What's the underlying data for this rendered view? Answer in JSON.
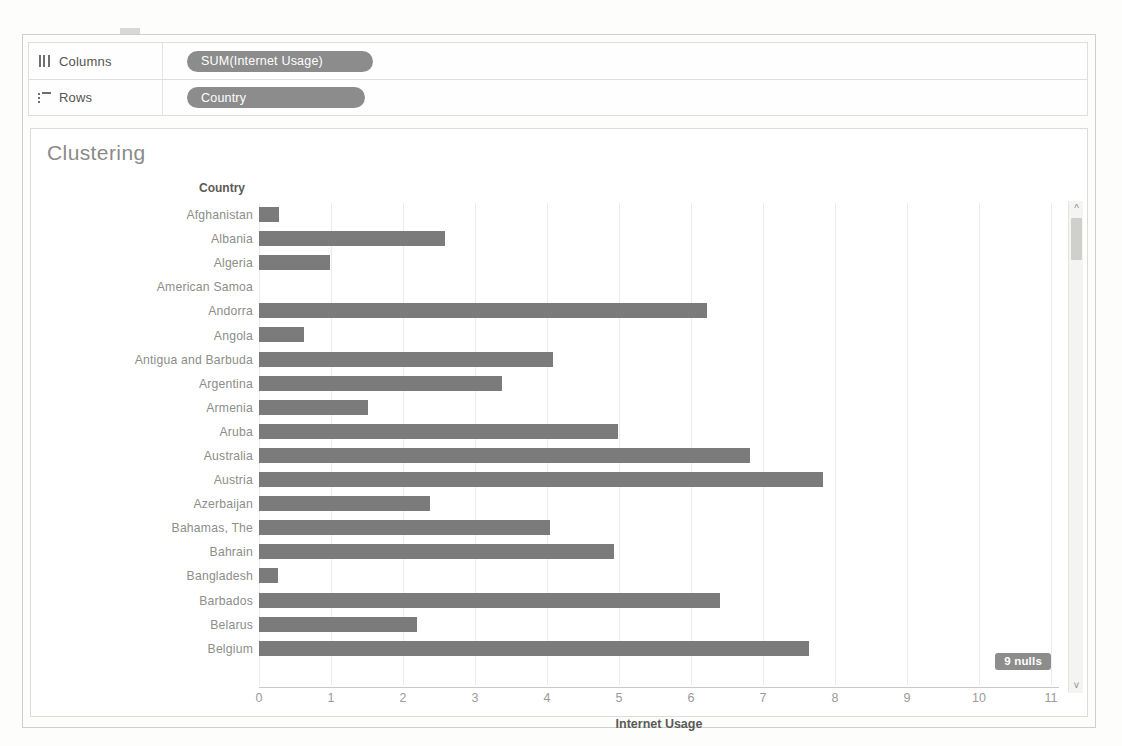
{
  "shelves": {
    "columns": {
      "label": "Columns",
      "icon": "columns-icon",
      "pill": "SUM(Internet Usage)"
    },
    "rows": {
      "label": "Rows",
      "icon": "rows-icon",
      "pill": "Country"
    }
  },
  "viz": {
    "title": "Clustering",
    "row_header_title": "Country",
    "nulls_badge": "9 nulls",
    "scroll_up_icon": "chevron-up-icon",
    "scroll_down_icon": "chevron-down-icon"
  },
  "chart_data": {
    "type": "bar",
    "orientation": "horizontal",
    "title": "Clustering",
    "xlabel": "Internet Usage",
    "ylabel": "Country",
    "xlim": [
      0,
      11.5
    ],
    "xticks": [
      0,
      1,
      2,
      3,
      4,
      5,
      6,
      7,
      8,
      9,
      10,
      11
    ],
    "xtick_labels": [
      "0",
      "1",
      "2",
      "3",
      "4",
      "5",
      "6",
      "7",
      "8",
      "9",
      "10",
      "11"
    ],
    "grid": true,
    "legend": false,
    "bar_color": "#7b7b7b",
    "measure": "SUM(Internet Usage)",
    "nulls": 9,
    "categories": [
      "Afghanistan",
      "Albania",
      "Algeria",
      "American Samoa",
      "Andorra",
      "Angola",
      "Antigua and Barbuda",
      "Argentina",
      "Armenia",
      "Aruba",
      "Australia",
      "Austria",
      "Azerbaijan",
      "Bahamas, The",
      "Bahrain",
      "Bangladesh",
      "Barbados",
      "Belarus",
      "Belgium"
    ],
    "values": [
      0.28,
      2.58,
      0.99,
      null,
      6.22,
      0.62,
      4.09,
      3.37,
      1.51,
      4.98,
      6.82,
      7.84,
      2.37,
      4.04,
      4.93,
      0.26,
      6.4,
      2.2,
      7.64
    ]
  }
}
